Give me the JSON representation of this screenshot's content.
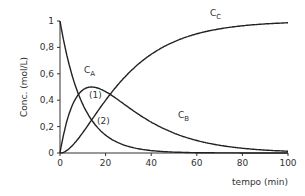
{
  "chart_data": {
    "type": "line",
    "title": "",
    "xlabel": "tempo (min)",
    "ylabel": "Conc. (mol/L)",
    "xlim": [
      0,
      100
    ],
    "ylim": [
      0,
      1
    ],
    "xticks": [
      "0",
      "20",
      "40",
      "60",
      "80",
      "100"
    ],
    "yticks": [
      "0",
      "0,2",
      "0,4",
      "0,6",
      "0,8",
      "1"
    ],
    "grid": false,
    "legend": "inline labels",
    "model": {
      "k1": 0.1,
      "k2": 0.05
    },
    "x": [
      0,
      5,
      10,
      15,
      20,
      30,
      40,
      50,
      60,
      70,
      80,
      90,
      100
    ],
    "series": [
      {
        "name": "C_A",
        "label": "C",
        "sub": "A",
        "values": [
          1.0,
          0.61,
          0.37,
          0.22,
          0.14,
          0.05,
          0.02,
          0.01,
          0.0,
          0.0,
          0.0,
          0.0,
          0.0
        ]
      },
      {
        "name": "C_B",
        "label": "C",
        "sub": "B",
        "values": [
          0.0,
          0.34,
          0.48,
          0.5,
          0.47,
          0.35,
          0.23,
          0.16,
          0.1,
          0.06,
          0.04,
          0.02,
          0.01
        ]
      },
      {
        "name": "C_C",
        "label": "C",
        "sub": "C",
        "values": [
          0.0,
          0.05,
          0.15,
          0.28,
          0.4,
          0.6,
          0.75,
          0.84,
          0.9,
          0.94,
          0.96,
          0.98,
          0.99
        ]
      }
    ],
    "annotations": [
      {
        "text": "(1)",
        "x": 14,
        "y": 0.5
      },
      {
        "text": "(2)",
        "x": 14,
        "y": 0.25
      }
    ]
  }
}
